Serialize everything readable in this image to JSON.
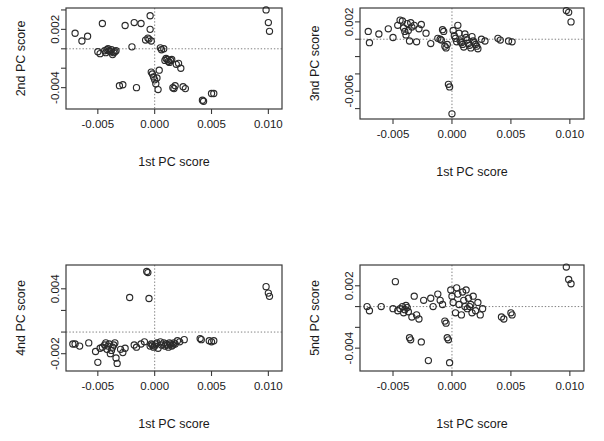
{
  "figure": {
    "type": "scatter-matrix",
    "panel_count": 4,
    "layout": "2x2",
    "background": "#ffffff",
    "point_style": {
      "marker": "open-circle",
      "stroke": "#2b2b2b",
      "fill": "none",
      "radius": 3.1
    },
    "guide_style": {
      "color": "#808080",
      "dashed": true,
      "description": "dotted crosshair at x=0 and y=0"
    }
  },
  "chart_data": [
    {
      "type": "scatter",
      "panel": "top-left",
      "title": "",
      "xlabel": "1st PC score",
      "ylabel": "2nd PC score",
      "xlim": [
        -0.0078,
        0.0112
      ],
      "ylim": [
        -0.0062,
        0.0042
      ],
      "xticks": [
        -0.005,
        0.0,
        0.005,
        0.01
      ],
      "xtick_labels": [
        "-0.005",
        "0.000",
        "0.005",
        "0.010"
      ],
      "yticks": [
        0.002,
        -0.004
      ],
      "ytick_labels": [
        "0.002",
        "-0.004"
      ],
      "ytick_all": [
        0.004,
        0.002,
        0.0,
        -0.002,
        -0.004
      ],
      "grid": false,
      "guides": {
        "x": 0.0,
        "y": 0.0
      },
      "x": [
        -0.007,
        -0.0064,
        -0.0059,
        -0.005,
        -0.0048,
        -0.0046,
        -0.0044,
        -0.0043,
        -0.0042,
        -0.0041,
        -0.004,
        -0.0039,
        -0.0038,
        -0.0037,
        -0.0036,
        -0.0035,
        -0.0034,
        -0.0031,
        -0.0028,
        -0.0026,
        -0.002,
        -0.0018,
        -0.0016,
        -0.0012,
        -0.0008,
        -0.0006,
        -0.0005,
        -0.0004,
        -0.0004,
        -0.0003,
        -0.0003,
        -0.0002,
        -0.0001,
        0.0,
        0.0001,
        0.0002,
        0.0003,
        0.0004,
        0.0005,
        0.0006,
        0.0008,
        0.0009,
        0.001,
        0.0011,
        0.0012,
        0.0013,
        0.0014,
        0.0015,
        0.0016,
        0.0017,
        0.0018,
        0.0019,
        0.0021,
        0.0023,
        0.0025,
        0.0027,
        0.0042,
        0.0043,
        0.005,
        0.0052,
        0.0098,
        0.01,
        0.0101
      ],
      "y": [
        0.0016,
        0.0008,
        0.0013,
        -0.0003,
        -0.0005,
        0.0026,
        -0.0002,
        -0.0004,
        -0.0001,
        0.0,
        -0.0002,
        -0.0003,
        -0.0001,
        -0.0006,
        -0.0004,
        -0.0003,
        -0.0002,
        -0.0038,
        -0.0037,
        0.0024,
        0.0002,
        0.0027,
        -0.004,
        0.0026,
        0.0009,
        0.0011,
        0.001,
        0.0034,
        0.002,
        0.0008,
        -0.0024,
        -0.0026,
        -0.0029,
        -0.0032,
        -0.0036,
        -0.003,
        -0.0042,
        -0.0022,
        0.0001,
        -0.0001,
        0.0,
        -0.0012,
        -0.001,
        -0.0011,
        -0.0013,
        -0.0014,
        -0.0012,
        -0.0011,
        -0.004,
        -0.0041,
        -0.0038,
        -0.0016,
        -0.0015,
        -0.002,
        -0.0039,
        -0.0041,
        -0.0053,
        -0.0054,
        -0.0046,
        -0.0046,
        0.004,
        0.0027,
        0.0018
      ]
    },
    {
      "type": "scatter",
      "panel": "top-right",
      "title": "",
      "xlabel": "1st PC score",
      "ylabel": "3nd PC score",
      "xlim": [
        -0.0078,
        0.0112
      ],
      "ylim": [
        -0.0092,
        0.0036
      ],
      "xticks": [
        -0.005,
        0.0,
        0.005,
        0.01
      ],
      "xtick_labels": [
        "-0.005",
        "0.000",
        "0.005",
        "0.010"
      ],
      "yticks": [
        0.002,
        -0.006
      ],
      "ytick_labels": [
        "0.002",
        "-0.006"
      ],
      "ytick_all": [
        0.002,
        0.0,
        -0.002,
        -0.004,
        -0.006,
        -0.008
      ],
      "grid": false,
      "guides": {
        "x": 0.0,
        "y": 0.0
      },
      "x": [
        -0.0071,
        -0.007,
        -0.0062,
        -0.0054,
        -0.005,
        -0.0046,
        -0.0044,
        -0.0042,
        -0.0041,
        -0.004,
        -0.0039,
        -0.0038,
        -0.0037,
        -0.0036,
        -0.0035,
        -0.0034,
        -0.0032,
        -0.003,
        -0.0028,
        -0.0026,
        -0.0022,
        -0.0018,
        -0.0012,
        -0.001,
        -0.0009,
        -0.0008,
        -0.0007,
        -0.0006,
        -0.0005,
        -0.0004,
        -0.0003,
        -0.0002,
        0.0,
        0.0001,
        0.0002,
        0.0003,
        0.0004,
        0.0005,
        0.0006,
        0.0007,
        0.0008,
        0.0009,
        0.001,
        0.0011,
        0.0012,
        0.0013,
        0.0014,
        0.0015,
        0.0016,
        0.0017,
        0.0018,
        0.0019,
        0.002,
        0.0021,
        0.0022,
        0.0025,
        0.0028,
        0.0039,
        0.0041,
        0.0048,
        0.0051,
        0.0097,
        0.0099,
        0.0101
      ],
      "y": [
        0.0009,
        -0.0004,
        0.0006,
        0.0012,
        0.0002,
        0.0016,
        0.0022,
        0.0021,
        0.0013,
        0.0009,
        0.0005,
        0.0018,
        0.001,
        -0.0002,
        0.0019,
        0.0014,
        0.0016,
        -0.0003,
        0.0012,
        0.0017,
        0.0007,
        -0.0005,
        0.0001,
        0.0,
        -0.0001,
        0.0011,
        0.0009,
        -0.0008,
        -0.001,
        -0.0006,
        -0.0052,
        -0.0055,
        -0.0086,
        0.001,
        0.0004,
        0.0001,
        -0.0003,
        0.0016,
        0.0007,
        -0.0002,
        -0.0004,
        -0.0006,
        -0.0009,
        0.0006,
        0.0002,
        -0.0001,
        -0.0005,
        -0.0007,
        -0.001,
        0.0003,
        -0.0002,
        -0.0004,
        -0.0006,
        -0.0008,
        -0.0011,
        0.0,
        -0.0002,
        0.0001,
        -0.0001,
        -0.0002,
        -0.0003,
        0.0033,
        0.0031,
        0.002
      ]
    },
    {
      "type": "scatter",
      "panel": "bottom-left",
      "title": "",
      "xlabel": "1st PC score",
      "ylabel": "4nd PC score",
      "xlim": [
        -0.0078,
        0.0112
      ],
      "ylim": [
        -0.0036,
        0.0062
      ],
      "xticks": [
        -0.005,
        0.0,
        0.005,
        0.01
      ],
      "xtick_labels": [
        "-0.005",
        "0.000",
        "0.005",
        "0.010"
      ],
      "yticks": [
        0.004,
        -0.002
      ],
      "ytick_labels": [
        "0.004",
        "-0.002"
      ],
      "ytick_all": [
        0.004,
        0.002,
        0.0,
        -0.002
      ],
      "grid": false,
      "guides": {
        "x": 0.0,
        "y": 0.0
      },
      "x": [
        -0.0072,
        -0.007,
        -0.0066,
        -0.0058,
        -0.0052,
        -0.005,
        -0.0048,
        -0.0046,
        -0.0044,
        -0.0043,
        -0.0042,
        -0.0041,
        -0.004,
        -0.0039,
        -0.0038,
        -0.0037,
        -0.0036,
        -0.0035,
        -0.0034,
        -0.0033,
        -0.003,
        -0.0028,
        -0.0026,
        -0.0022,
        -0.0018,
        -0.0016,
        -0.0012,
        -0.0009,
        -0.0007,
        -0.0006,
        -0.0005,
        -0.0004,
        -0.0003,
        -0.0002,
        -0.0001,
        0.0,
        0.0001,
        0.0002,
        0.0003,
        0.0005,
        0.0006,
        0.0008,
        0.0009,
        0.001,
        0.0011,
        0.0012,
        0.0013,
        0.0014,
        0.0015,
        0.0016,
        0.0017,
        0.0018,
        0.002,
        0.0022,
        0.0026,
        0.004,
        0.0041,
        0.0048,
        0.005,
        0.0052,
        0.0098,
        0.01,
        0.0101
      ],
      "y": [
        -0.0011,
        -0.0011,
        -0.0013,
        -0.001,
        -0.0018,
        -0.0028,
        -0.0015,
        -0.0014,
        -0.0012,
        -0.001,
        -0.0016,
        -0.0013,
        -0.0011,
        -0.002,
        -0.0017,
        -0.0014,
        -0.0012,
        -0.001,
        -0.0024,
        -0.0029,
        -0.0016,
        -0.0019,
        -0.0015,
        0.0032,
        -0.0012,
        -0.0014,
        -0.0011,
        -0.0009,
        0.0056,
        0.0055,
        0.0031,
        -0.0013,
        -0.0011,
        -0.0012,
        -0.0014,
        -0.0013,
        -0.0011,
        -0.001,
        -0.0015,
        -0.0009,
        -0.0012,
        -0.001,
        -0.0013,
        -0.0011,
        -0.0012,
        -0.0014,
        -0.001,
        -0.0011,
        -0.0013,
        -0.0012,
        -0.001,
        -0.0011,
        -0.0008,
        -0.0009,
        -0.0007,
        -0.0006,
        -0.0007,
        -0.0008,
        -0.0009,
        -0.0008,
        0.0042,
        0.0036,
        0.0033
      ]
    },
    {
      "type": "scatter",
      "panel": "bottom-right",
      "title": "",
      "xlabel": "1st PC score",
      "ylabel": "5nd PC score",
      "xlim": [
        -0.0078,
        0.0112
      ],
      "ylim": [
        -0.0062,
        0.004
      ],
      "xticks": [
        -0.005,
        0.0,
        0.005,
        0.01
      ],
      "xtick_labels": [
        "-0.005",
        "0.000",
        "0.005",
        "0.010"
      ],
      "yticks": [
        0.002,
        -0.004
      ],
      "ytick_labels": [
        "0.002",
        "-0.004"
      ],
      "ytick_all": [
        0.002,
        0.0,
        -0.002,
        -0.004
      ],
      "grid": false,
      "guides": {
        "x": 0.0,
        "y": 0.0
      },
      "x": [
        -0.0072,
        -0.007,
        -0.006,
        -0.005,
        -0.0048,
        -0.0046,
        -0.0044,
        -0.0042,
        -0.0041,
        -0.004,
        -0.0039,
        -0.0038,
        -0.0037,
        -0.0036,
        -0.0035,
        -0.0034,
        -0.0032,
        -0.003,
        -0.0028,
        -0.0026,
        -0.0024,
        -0.002,
        -0.0018,
        -0.0016,
        -0.0012,
        -0.001,
        -0.0008,
        -0.0006,
        -0.0005,
        -0.0004,
        -0.0003,
        -0.0002,
        -0.0001,
        0.0,
        0.0001,
        0.0003,
        0.0004,
        0.0005,
        0.0006,
        0.0008,
        0.0009,
        0.001,
        0.0011,
        0.0012,
        0.0013,
        0.0014,
        0.0015,
        0.0016,
        0.0017,
        0.0018,
        0.002,
        0.0022,
        0.0024,
        0.0026,
        0.0042,
        0.0044,
        0.005,
        0.0051,
        0.0097,
        0.0099,
        0.0101
      ],
      "y": [
        0.0,
        -0.0004,
        0.0,
        -0.0002,
        0.0024,
        -0.0004,
        -0.0002,
        0.0,
        -0.0006,
        -0.0003,
        0.0001,
        -0.0001,
        -0.0005,
        -0.003,
        -0.0032,
        -0.001,
        0.001,
        -0.0008,
        -0.0012,
        -0.0034,
        0.0006,
        -0.0052,
        0.0008,
        0.0,
        0.0012,
        0.0006,
        0.0002,
        -0.0014,
        -0.0016,
        -0.003,
        -0.0032,
        -0.0054,
        0.0016,
        0.001,
        0.0004,
        -0.0006,
        0.0018,
        0.0012,
        0.0002,
        -0.0008,
        0.0014,
        0.0006,
        0.0,
        0.0016,
        -0.0002,
        0.0008,
        0.0,
        0.0002,
        -0.0006,
        0.001,
        -0.0004,
        0.0004,
        -0.0008,
        -0.0002,
        -0.001,
        -0.0012,
        -0.0006,
        -0.0008,
        0.0038,
        0.0026,
        0.0022
      ]
    }
  ]
}
